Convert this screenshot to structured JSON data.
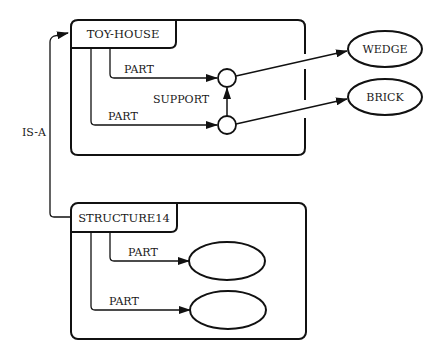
{
  "diagram": {
    "type": "semantic-network",
    "colors": {
      "ink": "#111111",
      "background": "#ffffff"
    },
    "frames": [
      {
        "id": "toy-house",
        "label": "TOY-HOUSE",
        "slots": [
          {
            "relation": "PART",
            "target": "node-a"
          },
          {
            "relation": "PART",
            "target": "node-b"
          }
        ]
      },
      {
        "id": "structure14",
        "label": "STRUCTURE14",
        "slots": [
          {
            "relation": "PART",
            "target": "empty-ellipse-1"
          },
          {
            "relation": "PART",
            "target": "empty-ellipse-2"
          }
        ]
      }
    ],
    "nodes": [
      {
        "id": "wedge",
        "label": "WEDGE"
      },
      {
        "id": "brick",
        "label": "BRICK"
      },
      {
        "id": "empty-ellipse-1",
        "label": ""
      },
      {
        "id": "empty-ellipse-2",
        "label": ""
      }
    ],
    "edges": {
      "is_a": "IS-A",
      "support": "SUPPORT",
      "part_top_1": "PART",
      "part_top_2": "PART",
      "part_bottom_1": "PART",
      "part_bottom_2": "PART"
    }
  }
}
